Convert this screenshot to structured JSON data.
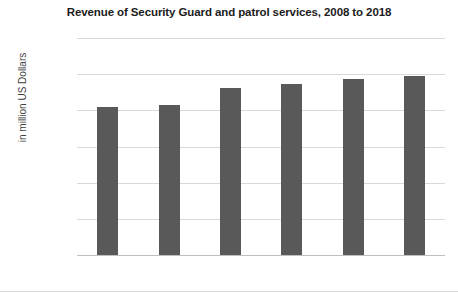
{
  "chart_data": {
    "type": "bar",
    "title": "Revenue of Security Guard and patrol services, 2008 to 2018",
    "xlabel": "",
    "ylabel": "in million US Dollars",
    "categories": [
      "2008",
      "2010",
      "2012",
      "2014",
      "2016",
      "2018"
    ],
    "values": [
      20400,
      20800,
      23100,
      23700,
      24400,
      24800
    ],
    "series": [
      {
        "name": "Revenue",
        "values": [
          20400,
          20800,
          23100,
          23700,
          24400,
          24800
        ]
      }
    ],
    "ylim": [
      0,
      30000
    ],
    "y_ticks": [
      0,
      5000,
      10000,
      15000,
      20000,
      25000,
      30000
    ],
    "y_tick_labels": [
      "0",
      "5000",
      "10000",
      "15000",
      "20000",
      "25000",
      "30000"
    ],
    "grid": true,
    "legend": false,
    "legend_position": "none",
    "bar_color": "#595959",
    "gridline_color": "#d9d9d9",
    "background_color": "#ffffff",
    "text_color": "#3f3f3f",
    "title_color": "#1c1c1c"
  }
}
